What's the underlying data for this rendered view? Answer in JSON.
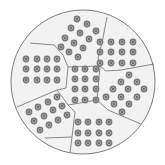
{
  "diagram": {
    "colors": {
      "background": "#ffffff",
      "disc_fill": "#f2f2f2",
      "boundary_stroke": "#6e6e6e",
      "dot_fill": "#7a7a7a",
      "dot_ring": "#b5b5b5",
      "dot_center": "#5a5a5a"
    },
    "circle": {
      "cx": 83,
      "cy": 82,
      "r": 72
    },
    "boundaries": [
      {
        "name": "left-top-edge",
        "points": "30,43 54,45 63,55 68,67"
      },
      {
        "name": "top-right-edge",
        "points": "107,17 102,43 98,58 100,66"
      },
      {
        "name": "center-top-edge",
        "points": "68,67 100,66"
      },
      {
        "name": "upperright-bottom-edge",
        "points": "100,66 106,71 121,70 154,64"
      },
      {
        "name": "left-right-edge",
        "points": "68,67 66,88 57,90"
      },
      {
        "name": "lowerleft-top-edge",
        "points": "17,107 57,90 68,105"
      },
      {
        "name": "center-right-edge",
        "points": "100,66 97,100 108,110 141,124"
      },
      {
        "name": "center-bottom-edge",
        "points": "68,105 97,100"
      },
      {
        "name": "lowerleft-right-edge",
        "points": "68,105 75,112 72,137 70,153"
      },
      {
        "name": "lowerleft-bottom-edge",
        "points": "45,138 72,137"
      }
    ],
    "regions": [
      {
        "name": "top-region",
        "dot_count": 12,
        "dots": [
          [
            77,
            19
          ],
          [
            87,
            24
          ],
          [
            96,
            31
          ],
          [
            71,
            28
          ],
          [
            80,
            33
          ],
          [
            89,
            39
          ],
          [
            65,
            38
          ],
          [
            74,
            43
          ],
          [
            83,
            48
          ],
          [
            61,
            47
          ],
          [
            69,
            52
          ],
          [
            78,
            57
          ]
        ]
      },
      {
        "name": "upper-right-region",
        "dot_count": 12,
        "dots": [
          [
            100,
            42
          ],
          [
            111,
            42
          ],
          [
            122,
            42
          ],
          [
            133,
            42
          ],
          [
            100,
            52
          ],
          [
            111,
            52
          ],
          [
            122,
            52
          ],
          [
            133,
            52
          ],
          [
            100,
            63
          ],
          [
            111,
            63
          ],
          [
            122,
            63
          ],
          [
            133,
            63
          ]
        ]
      },
      {
        "name": "left-region",
        "dot_count": 12,
        "dots": [
          [
            26,
            59
          ],
          [
            37,
            59
          ],
          [
            47,
            59
          ],
          [
            57,
            59
          ],
          [
            26,
            69
          ],
          [
            37,
            69
          ],
          [
            47,
            69
          ],
          [
            57,
            69
          ],
          [
            26,
            80
          ],
          [
            37,
            80
          ],
          [
            47,
            80
          ],
          [
            57,
            80
          ]
        ]
      },
      {
        "name": "center-region",
        "dot_count": 12,
        "dots": [
          [
            75,
            69
          ],
          [
            85,
            69
          ],
          [
            96,
            69
          ],
          [
            75,
            79
          ],
          [
            85,
            79
          ],
          [
            96,
            79
          ],
          [
            75,
            89
          ],
          [
            85,
            89
          ],
          [
            96,
            89
          ],
          [
            75,
            100
          ],
          [
            85,
            100
          ],
          [
            96,
            100
          ]
        ]
      },
      {
        "name": "right-region",
        "dot_count": 12,
        "dots": [
          [
            129,
            75
          ],
          [
            121,
            82
          ],
          [
            137,
            82
          ],
          [
            113,
            89
          ],
          [
            128,
            89
          ],
          [
            144,
            89
          ],
          [
            106,
            97
          ],
          [
            121,
            97
          ],
          [
            137,
            97
          ],
          [
            114,
            104
          ],
          [
            129,
            104
          ],
          [
            122,
            112
          ]
        ]
      },
      {
        "name": "lower-left-region",
        "dot_count": 12,
        "dots": [
          [
            57,
            97
          ],
          [
            48,
            102
          ],
          [
            38,
            107
          ],
          [
            29,
            112
          ],
          [
            62,
            106
          ],
          [
            53,
            110
          ],
          [
            44,
            116
          ],
          [
            34,
            121
          ],
          [
            67,
            115
          ],
          [
            58,
            120
          ],
          [
            49,
            125
          ],
          [
            40,
            130
          ]
        ]
      },
      {
        "name": "bottom-region",
        "dot_count": 12,
        "dots": [
          [
            78,
            122
          ],
          [
            88,
            122
          ],
          [
            99,
            122
          ],
          [
            109,
            122
          ],
          [
            78,
            133
          ],
          [
            88,
            133
          ],
          [
            99,
            133
          ],
          [
            109,
            133
          ],
          [
            78,
            143
          ],
          [
            88,
            143
          ],
          [
            99,
            143
          ],
          [
            109,
            143
          ]
        ]
      }
    ],
    "dot_radius": 3.4
  }
}
